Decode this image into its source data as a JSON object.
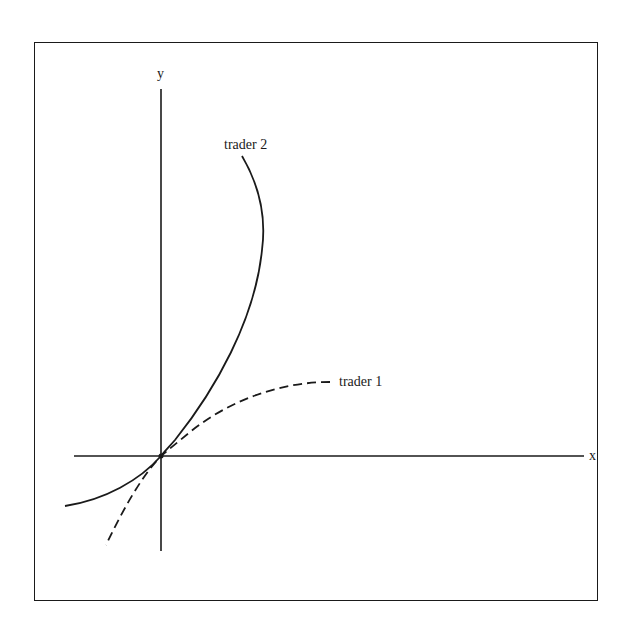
{
  "diagram": {
    "axes": {
      "x_label": "x",
      "y_label": "y"
    },
    "curves": [
      {
        "name": "trader 2",
        "style": "solid",
        "label": "trader 2"
      },
      {
        "name": "trader 1",
        "style": "dashed",
        "label": "trader 1"
      }
    ],
    "colors": {
      "ink": "#1a1a1a",
      "background": "#ffffff"
    }
  }
}
